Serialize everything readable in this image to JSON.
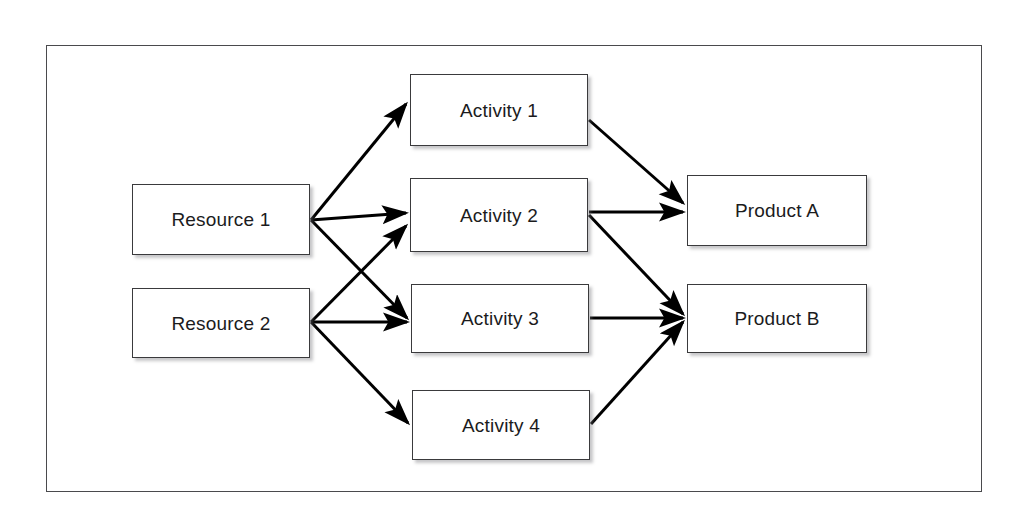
{
  "diagram": {
    "frame": {
      "x": 46,
      "y": 45,
      "width": 936,
      "height": 447,
      "border_color": "#4a4a4d"
    },
    "style": {
      "node_fill": "#ffffff",
      "node_border": "#3a3a3c",
      "edge_color": "#000000",
      "background": "#ffffff",
      "shadow_color": "#78787c"
    },
    "nodes": [
      {
        "id": "resource-1",
        "label": "Resource 1",
        "type": "resource",
        "x": 132,
        "y": 184,
        "width": 178,
        "height": 71
      },
      {
        "id": "resource-2",
        "label": "Resource 2",
        "type": "resource",
        "x": 132,
        "y": 288,
        "width": 178,
        "height": 70
      },
      {
        "id": "activity-1",
        "label": "Activity 1",
        "type": "activity",
        "x": 410,
        "y": 74,
        "width": 178,
        "height": 72
      },
      {
        "id": "activity-2",
        "label": "Activity 2",
        "type": "activity",
        "x": 410,
        "y": 178,
        "width": 178,
        "height": 74
      },
      {
        "id": "activity-3",
        "label": "Activity 3",
        "type": "activity",
        "x": 411,
        "y": 284,
        "width": 178,
        "height": 69
      },
      {
        "id": "activity-4",
        "label": "Activity 4",
        "type": "activity",
        "x": 412,
        "y": 390,
        "width": 178,
        "height": 70
      },
      {
        "id": "product-a",
        "label": "Product A",
        "type": "product",
        "x": 687,
        "y": 175,
        "width": 180,
        "height": 71
      },
      {
        "id": "product-b",
        "label": "Product B",
        "type": "product",
        "x": 687,
        "y": 284,
        "width": 180,
        "height": 69
      }
    ],
    "edges": [
      {
        "id": "edge-resource1-activity1",
        "from": "resource-1",
        "to": "activity-1",
        "x1": 311,
        "y1": 220,
        "x2": 406,
        "y2": 104
      },
      {
        "id": "edge-resource1-activity2",
        "from": "resource-1",
        "to": "activity-2",
        "x1": 311,
        "y1": 220,
        "x2": 406,
        "y2": 213
      },
      {
        "id": "edge-resource1-activity3",
        "from": "resource-1",
        "to": "activity-3",
        "x1": 311,
        "y1": 220,
        "x2": 407,
        "y2": 318
      },
      {
        "id": "edge-resource2-activity2",
        "from": "resource-2",
        "to": "activity-2",
        "x1": 311,
        "y1": 322,
        "x2": 406,
        "y2": 226
      },
      {
        "id": "edge-resource2-activity3",
        "from": "resource-2",
        "to": "activity-3",
        "x1": 311,
        "y1": 322,
        "x2": 407,
        "y2": 322
      },
      {
        "id": "edge-resource2-activity4",
        "from": "resource-2",
        "to": "activity-4",
        "x1": 311,
        "y1": 322,
        "x2": 408,
        "y2": 423
      },
      {
        "id": "edge-activity1-productA",
        "from": "activity-1",
        "to": "product-a",
        "x1": 589,
        "y1": 120,
        "x2": 683,
        "y2": 203
      },
      {
        "id": "edge-activity2-productA",
        "from": "activity-2",
        "to": "product-a",
        "x1": 589,
        "y1": 212,
        "x2": 683,
        "y2": 212
      },
      {
        "id": "edge-activity2-productB",
        "from": "activity-2",
        "to": "product-b",
        "x1": 589,
        "y1": 215,
        "x2": 683,
        "y2": 314
      },
      {
        "id": "edge-activity3-productB",
        "from": "activity-3",
        "to": "product-b",
        "x1": 590,
        "y1": 318,
        "x2": 683,
        "y2": 318
      },
      {
        "id": "edge-activity4-productB",
        "from": "activity-4",
        "to": "product-b",
        "x1": 591,
        "y1": 424,
        "x2": 683,
        "y2": 322
      }
    ]
  }
}
